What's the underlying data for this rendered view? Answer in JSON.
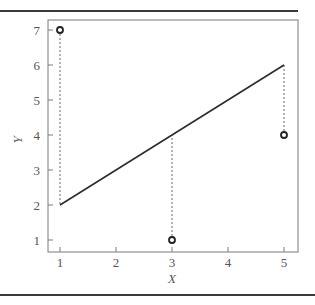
{
  "chart_data": {
    "type": "scatter",
    "title": "",
    "xlabel": "X",
    "ylabel": "Y",
    "xlim": [
      0.8,
      5.25
    ],
    "ylim": [
      0.65,
      7.35
    ],
    "grid": false,
    "legend": null,
    "x_ticks": [
      1,
      2,
      3,
      4,
      5
    ],
    "y_ticks": [
      1,
      2,
      3,
      4,
      5,
      6,
      7
    ],
    "series": [
      {
        "name": "observed points",
        "style": "open-circle",
        "points": [
          {
            "x": 1,
            "y": 7
          },
          {
            "x": 3,
            "y": 1
          },
          {
            "x": 5,
            "y": 4
          }
        ]
      },
      {
        "name": "fitted line",
        "style": "solid-line",
        "points": [
          {
            "x": 1,
            "y": 2
          },
          {
            "x": 5,
            "y": 6
          }
        ]
      }
    ],
    "annotations": [
      {
        "type": "dashed-residual",
        "x": 1,
        "from": 7,
        "to": 2
      },
      {
        "type": "dashed-residual",
        "x": 3,
        "from": 1,
        "to": 4
      },
      {
        "type": "dashed-residual",
        "x": 5,
        "from": 4,
        "to": 6
      }
    ]
  },
  "colors": {
    "axis": "#7a7a7a",
    "line": "#2b2b2b",
    "marker": "#222222",
    "rule": "#3a3a3a"
  }
}
